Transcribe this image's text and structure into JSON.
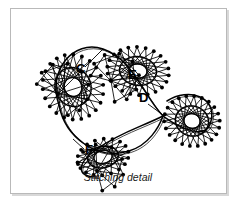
{
  "figure": {
    "caption": "Stitching detail",
    "border_color": "#b9b9b9",
    "background_color": "#ffffff",
    "ink_color": "#000000",
    "labels": [
      {
        "id": "C",
        "text": "C",
        "x": 65,
        "y": 64,
        "leader": [
          74,
          58,
          92,
          40
        ]
      },
      {
        "id": "E",
        "text": "E",
        "x": 117,
        "y": 70,
        "leader": [
          121,
          74,
          113,
          88
        ]
      },
      {
        "id": "D",
        "text": "D",
        "x": 128,
        "y": 93,
        "leader": [
          137,
          95,
          152,
          106
        ]
      },
      {
        "id": "F",
        "text": "F",
        "x": 74,
        "y": 145,
        "leader": [
          73,
          140,
          62,
          130
        ]
      }
    ],
    "lobes": [
      {
        "name": "left-lobe",
        "cx": 62,
        "cy": 78,
        "rx": 30,
        "ry": 33,
        "rot": -22,
        "nodes": 22,
        "skip": 9
      },
      {
        "name": "upper-lobe",
        "cx": 127,
        "cy": 62,
        "rx": 31,
        "ry": 24,
        "rot": 8,
        "nodes": 22,
        "skip": 9
      },
      {
        "name": "right-lobe",
        "cx": 181,
        "cy": 112,
        "rx": 28,
        "ry": 25,
        "rot": 14,
        "nodes": 22,
        "skip": 9
      },
      {
        "name": "lower-lobe",
        "cx": 92,
        "cy": 148,
        "rx": 26,
        "ry": 18,
        "rot": -12,
        "nodes": 18,
        "skip": 7
      }
    ],
    "fan_clusters": [
      {
        "name": "left-fan",
        "hub_x": 47,
        "hub_y": 85,
        "count": 9,
        "start_deg": 205,
        "end_deg": 65,
        "len": 30
      },
      {
        "name": "upper-fan",
        "hub_x": 100,
        "hub_y": 72,
        "count": 9,
        "start_deg": 195,
        "end_deg": 80,
        "len": 27
      },
      {
        "name": "lower-fan",
        "hub_x": 86,
        "hub_y": 162,
        "count": 8,
        "start_deg": 200,
        "end_deg": 75,
        "len": 26
      }
    ],
    "crossing_point": {
      "x": 152,
      "y": 107
    },
    "dot_radius": 1.9,
    "stroke_width": 0.85
  }
}
